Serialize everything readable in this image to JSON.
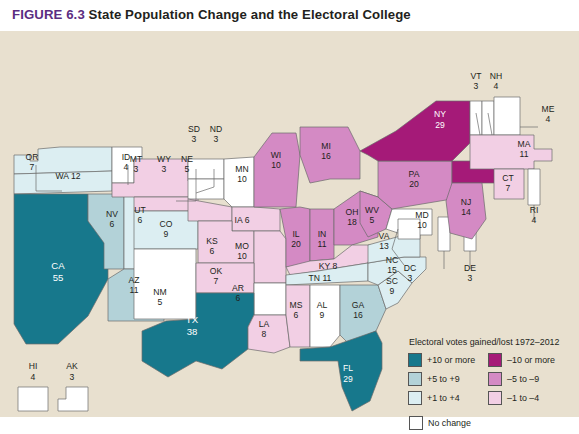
{
  "figure": {
    "number": "FIGURE 6.3",
    "title": "State Population Change and the Electoral College"
  },
  "legend": {
    "title": "Electoral votes gained/lost 1972–2012",
    "gain": [
      {
        "label": "+10 or more",
        "color": "#17788c"
      },
      {
        "label": "+5 to +9",
        "color": "#b3d2d8"
      },
      {
        "label": "+1 to +4",
        "color": "#dceef2"
      }
    ],
    "loss": [
      {
        "label": "–10 or more",
        "color": "#a51a78"
      },
      {
        "label": "–5 to –9",
        "color": "#d48ac4"
      },
      {
        "label": "–1 to –4",
        "color": "#f2cfe4"
      }
    ],
    "nochange": {
      "label": "No change",
      "color": "#ffffff"
    }
  },
  "colors": {
    "paper": "#e8e0cf",
    "title_purple": "#5b2d82",
    "border": "#6a6a6a",
    "gain_10plus": "#17788c",
    "gain_5to9": "#b3d2d8",
    "gain_1to4": "#dceef2",
    "loss_10plus": "#a51a78",
    "loss_5to9": "#d48ac4",
    "loss_1to4": "#f2cfe4",
    "nochange": "#ffffff"
  },
  "states": [
    {
      "code": "WA",
      "votes": "12",
      "label": "WA 12",
      "category": "+1 to +4"
    },
    {
      "code": "OR",
      "votes": "7",
      "label": "OR",
      "category": "+1 to +4"
    },
    {
      "code": "CA",
      "votes": "55",
      "label": "CA",
      "category": "+10 or more"
    },
    {
      "code": "ID",
      "votes": "4",
      "label": "ID",
      "category": "No change"
    },
    {
      "code": "NV",
      "votes": "6",
      "label": "NV",
      "category": "+5 to +9"
    },
    {
      "code": "UT",
      "votes": "6",
      "label": "UT",
      "category": "+1 to +4"
    },
    {
      "code": "AZ",
      "votes": "11",
      "label": "AZ",
      "category": "+5 to +9"
    },
    {
      "code": "MT",
      "votes": "3",
      "label": "MT",
      "category": "–1 to –4"
    },
    {
      "code": "WY",
      "votes": "3",
      "label": "WY",
      "category": "–1 to –4"
    },
    {
      "code": "CO",
      "votes": "9",
      "label": "CO",
      "category": "+1 to +4"
    },
    {
      "code": "NM",
      "votes": "5",
      "label": "NM",
      "category": "No change"
    },
    {
      "code": "ND",
      "votes": "3",
      "label": "ND",
      "category": "No change"
    },
    {
      "code": "SD",
      "votes": "3",
      "label": "SD",
      "category": "No change"
    },
    {
      "code": "NE",
      "votes": "5",
      "label": "NE",
      "category": "–1 to –4"
    },
    {
      "code": "KS",
      "votes": "6",
      "label": "KS",
      "category": "–1 to –4"
    },
    {
      "code": "OK",
      "votes": "7",
      "label": "OK",
      "category": "–1 to –4"
    },
    {
      "code": "TX",
      "votes": "38",
      "label": "TX",
      "category": "+10 or more"
    },
    {
      "code": "MN",
      "votes": "10",
      "label": "MN",
      "category": "No change"
    },
    {
      "code": "IA",
      "votes": "6",
      "label": "IA 6",
      "category": "–1 to –4"
    },
    {
      "code": "MO",
      "votes": "10",
      "label": "MO",
      "category": "–1 to –4"
    },
    {
      "code": "AR",
      "votes": "6",
      "label": "AR",
      "category": "No change"
    },
    {
      "code": "LA",
      "votes": "8",
      "label": "LA",
      "category": "–1 to –4"
    },
    {
      "code": "WI",
      "votes": "10",
      "label": "WI",
      "category": "–5 to –9"
    },
    {
      "code": "IL",
      "votes": "20",
      "label": "IL",
      "category": "–5 to –9"
    },
    {
      "code": "MI",
      "votes": "16",
      "label": "MI",
      "category": "–5 to –9"
    },
    {
      "code": "IN",
      "votes": "11",
      "label": "IN",
      "category": "–5 to –9"
    },
    {
      "code": "OH",
      "votes": "18",
      "label": "OH",
      "category": "–5 to –9"
    },
    {
      "code": "KY",
      "votes": "8",
      "label": "KY 8",
      "category": "–1 to –4"
    },
    {
      "code": "TN",
      "votes": "11",
      "label": "TN 11",
      "category": "+1 to +4"
    },
    {
      "code": "MS",
      "votes": "6",
      "label": "MS",
      "category": "–1 to –4"
    },
    {
      "code": "AL",
      "votes": "9",
      "label": "AL",
      "category": "No change"
    },
    {
      "code": "GA",
      "votes": "16",
      "label": "GA",
      "category": "+5 to +9"
    },
    {
      "code": "FL",
      "votes": "29",
      "label": "FL",
      "category": "+10 or more"
    },
    {
      "code": "SC",
      "votes": "9",
      "label": "SC",
      "category": "+1 to +4"
    },
    {
      "code": "NC",
      "votes": "15",
      "label": "NC",
      "category": "+1 to +4"
    },
    {
      "code": "VA",
      "votes": "13",
      "label": "VA",
      "category": "+1 to +4"
    },
    {
      "code": "WV",
      "votes": "5",
      "label": "WV",
      "category": "–5 to –9"
    },
    {
      "code": "MD",
      "votes": "10",
      "label": "MD",
      "category": "No change"
    },
    {
      "code": "DC",
      "votes": "3",
      "label": "DC",
      "category": "No change"
    },
    {
      "code": "DE",
      "votes": "3",
      "label": "DE",
      "category": "No change"
    },
    {
      "code": "PA",
      "votes": "20",
      "label": "PA",
      "category": "–5 to –9"
    },
    {
      "code": "NJ",
      "votes": "14",
      "label": "NJ",
      "category": "–5 to –9"
    },
    {
      "code": "NY",
      "votes": "29",
      "label": "NY",
      "category": "–10 or more"
    },
    {
      "code": "CT",
      "votes": "7",
      "label": "CT",
      "category": "–1 to –4"
    },
    {
      "code": "RI",
      "votes": "4",
      "label": "RI",
      "category": "No change"
    },
    {
      "code": "MA",
      "votes": "11",
      "label": "MA",
      "category": "–1 to –4"
    },
    {
      "code": "VT",
      "votes": "3",
      "label": "VT",
      "category": "No change"
    },
    {
      "code": "NH",
      "votes": "4",
      "label": "NH",
      "category": "No change"
    },
    {
      "code": "ME",
      "votes": "4",
      "label": "ME",
      "category": "No change"
    },
    {
      "code": "HI",
      "votes": "4",
      "label": "HI",
      "category": "No change"
    },
    {
      "code": "AK",
      "votes": "3",
      "label": "AK",
      "category": "No change"
    }
  ]
}
